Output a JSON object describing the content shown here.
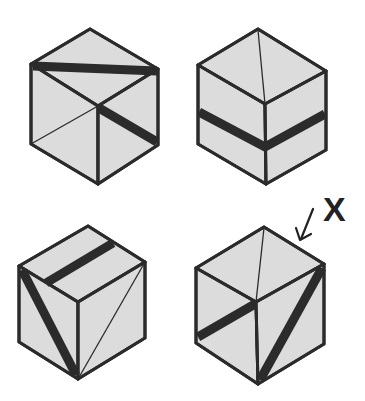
{
  "figure": {
    "colors": {
      "face": "#dcdcdc",
      "line": "#2b2b2b",
      "background": "#ffffff"
    },
    "cubes": [
      {
        "id": "cube-a",
        "position": "top-left",
        "marked": false
      },
      {
        "id": "cube-b",
        "position": "top-right",
        "marked": false
      },
      {
        "id": "cube-c",
        "position": "bottom-left",
        "marked": false
      },
      {
        "id": "cube-d",
        "position": "bottom-right",
        "marked": true
      }
    ],
    "marker": {
      "label": "X"
    }
  }
}
